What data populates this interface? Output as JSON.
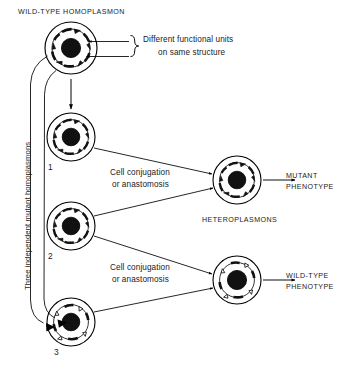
{
  "diagram": {
    "title_top": "WILD-TYPE HOMOPLASMON",
    "annotation_brace": {
      "line1": "Different functional units",
      "line2": "on same structure"
    },
    "vertical_label": "Three independent mutant homoplasmons",
    "heteroplasmons_label": "HETEROPLASMONS",
    "process_top": {
      "line1": "Cell conjugation",
      "line2": "or anastomosis"
    },
    "process_bottom": {
      "line1": "Cell conjugation",
      "line2": "or anastomosis"
    },
    "outcome_mutant": {
      "line1": "MUTANT",
      "line2": "PHENOTYPE"
    },
    "outcome_wildtype": {
      "line1": "WILD-TYPE",
      "line2": "PHENOTYPE"
    },
    "mutant_numbers": {
      "one": "1",
      "two": "2",
      "three": "3"
    },
    "colors": {
      "ink": "#1a1a1a",
      "stroke": "#000000",
      "background": "#ffffff",
      "nucleus_fill": "#111111"
    },
    "plasmon_cells": [
      {
        "id": "wild-type-homoplasmon",
        "cx": 71,
        "cy": 48,
        "r": 26,
        "marker_style": "filled"
      },
      {
        "id": "mutant-homoplasmon-1",
        "cx": 71,
        "cy": 137,
        "r": 24,
        "marker_style": "filled"
      },
      {
        "id": "mutant-homoplasmon-2",
        "cx": 71,
        "cy": 226,
        "r": 24,
        "marker_style": "filled"
      },
      {
        "id": "mutant-homoplasmon-3",
        "cx": 71,
        "cy": 322,
        "r": 24,
        "marker_style": "mixed"
      },
      {
        "id": "heteroplasmon-mutant",
        "cx": 237,
        "cy": 180,
        "r": 24,
        "marker_style": "filled"
      },
      {
        "id": "heteroplasmon-wildtype",
        "cx": 237,
        "cy": 280,
        "r": 24,
        "marker_style": "mixed"
      }
    ]
  }
}
